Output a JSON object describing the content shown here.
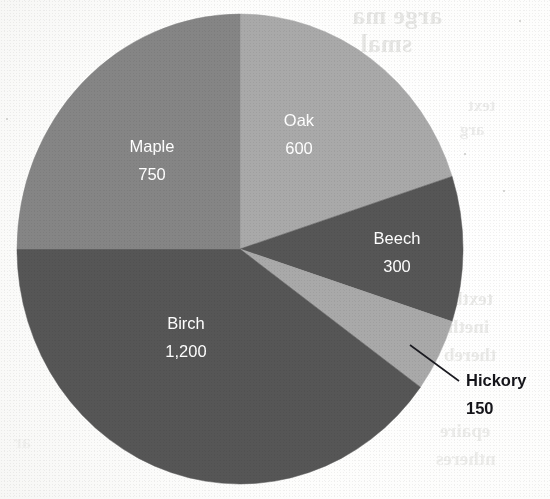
{
  "chart_data": {
    "type": "pie",
    "title": "",
    "subtitle": "",
    "total": 3000,
    "start_angle_deg": 0,
    "direction": "clockwise",
    "legend": "none",
    "labels_position": "inside-slice",
    "categories": [
      "Oak",
      "Beech",
      "Hickory",
      "Birch",
      "Maple"
    ],
    "values": [
      600,
      300,
      150,
      1200,
      750
    ],
    "value_labels": [
      "600",
      "300",
      "150",
      "1,200",
      "750"
    ],
    "slices": [
      {
        "name": "Oak",
        "label": "Oak",
        "value": 600,
        "value_label": "600",
        "percent": 20,
        "angle_deg": 72,
        "start_deg": 0,
        "end_deg": 72,
        "color": "#a9a9a9",
        "label_color": "#ffffff",
        "label_placement": "inside",
        "label_x": 299,
        "label_y": 122
      },
      {
        "name": "Beech",
        "label": "Beech",
        "value": 300,
        "value_label": "300",
        "percent": 10,
        "angle_deg": 36,
        "start_deg": 72,
        "end_deg": 108,
        "color": "#565656",
        "label_color": "#ffffff",
        "label_placement": "inside",
        "label_x": 397,
        "label_y": 240
      },
      {
        "name": "Hickory",
        "label": "Hickory",
        "value": 150,
        "value_label": "150",
        "percent": 5,
        "angle_deg": 18,
        "start_deg": 108,
        "end_deg": 126,
        "color": "#a9a9a9",
        "label_color": "#15151a",
        "label_placement": "callout",
        "label_x": 466,
        "label_y": 382,
        "leader_from_x": 410,
        "leader_from_y": 345,
        "leader_to_x": 459,
        "leader_to_y": 381
      },
      {
        "name": "Birch",
        "label": "Birch",
        "value": 1200,
        "value_label": "1,200",
        "percent": 40,
        "angle_deg": 144,
        "start_deg": 126,
        "end_deg": 270,
        "color": "#565656",
        "label_color": "#ffffff",
        "label_placement": "inside",
        "label_x": 186,
        "label_y": 325
      },
      {
        "name": "Maple",
        "label": "Maple",
        "value": 750,
        "value_label": "750",
        "percent": 25,
        "angle_deg": 90,
        "start_deg": 270,
        "end_deg": 360,
        "color": "#858585",
        "label_color": "#ffffff",
        "label_placement": "inside",
        "label_x": 152,
        "label_y": 148
      }
    ],
    "geometry": {
      "center_x": 240,
      "center_y": 249,
      "radius_x": 223,
      "radius_y": 235
    },
    "colors": {
      "light_gray": "#a9a9a9",
      "medium_gray": "#858585",
      "dark_gray": "#565656",
      "label_white": "#ffffff",
      "callout_black": "#15151a",
      "paper": "#fbfbfa"
    }
  },
  "page": {
    "background_color": "#fbfbfa",
    "show_through_text": [
      "arge ma",
      "smal",
      "text",
      "arg",
      "textb",
      "ineth",
      "thereb",
      "epaire",
      "ntheres",
      "ar"
    ]
  }
}
